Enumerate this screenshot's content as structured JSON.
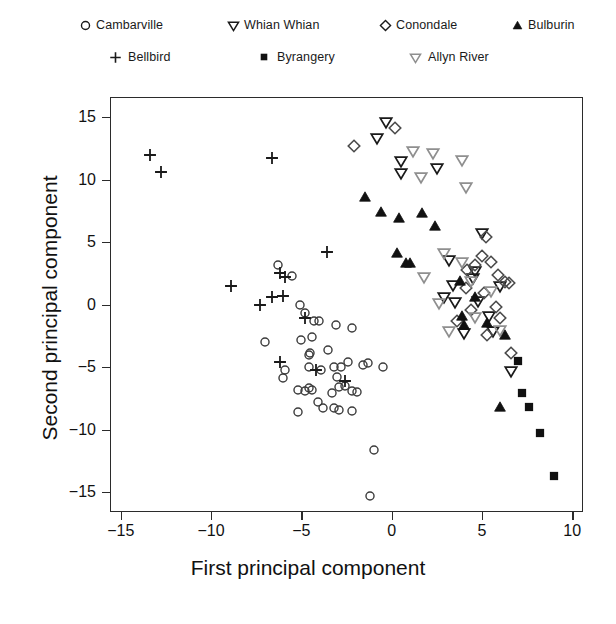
{
  "chart_data": {
    "type": "scatter",
    "title": "",
    "xlabel": "First principal component",
    "ylabel": "Second principal component",
    "xlim": [
      -15.6,
      10.6
    ],
    "ylim": [
      -16.6,
      16.6
    ],
    "xticks": [
      -15,
      -10,
      -5,
      0,
      5,
      10
    ],
    "yticks": [
      -15,
      -10,
      -5,
      0,
      5,
      10,
      15
    ],
    "xticklabels": [
      "−15",
      "−10",
      "−5",
      "0",
      "5",
      "10"
    ],
    "yticklabels": [
      "−15",
      "−10",
      "−5",
      "0",
      "5",
      "10",
      "15"
    ],
    "grid": false,
    "legend_position": "top",
    "series": [
      {
        "name": "Cambarville",
        "marker": "circle-open",
        "color": "#3b3b3b",
        "points": [
          [
            -6.3,
            3.2
          ],
          [
            -5.5,
            2.3
          ],
          [
            -5.1,
            0.0
          ],
          [
            -4.8,
            -0.7
          ],
          [
            -4.3,
            -1.3
          ],
          [
            -4.0,
            -1.3
          ],
          [
            -7.0,
            -3.0
          ],
          [
            -4.4,
            -2.6
          ],
          [
            -3.1,
            -1.6
          ],
          [
            -2.2,
            -1.9
          ],
          [
            -4.5,
            -3.9
          ],
          [
            -4.6,
            -4.0
          ],
          [
            -3.5,
            -3.6
          ],
          [
            -5.9,
            -5.2
          ],
          [
            -4.6,
            -5.0
          ],
          [
            -3.9,
            -5.2
          ],
          [
            -3.2,
            -5.0
          ],
          [
            -2.8,
            -5.0
          ],
          [
            -3.0,
            -5.8
          ],
          [
            -2.4,
            -4.6
          ],
          [
            -1.6,
            -4.8
          ],
          [
            -5.2,
            -6.8
          ],
          [
            -4.8,
            -6.9
          ],
          [
            -4.6,
            -6.7
          ],
          [
            -4.4,
            -6.8
          ],
          [
            -4.1,
            -7.8
          ],
          [
            -3.3,
            -7.1
          ],
          [
            -2.9,
            -6.6
          ],
          [
            -2.6,
            -6.5
          ],
          [
            -2.2,
            -6.9
          ],
          [
            -1.9,
            -7.0
          ],
          [
            -5.2,
            -8.6
          ],
          [
            -3.8,
            -8.3
          ],
          [
            -3.2,
            -8.3
          ],
          [
            -2.9,
            -8.4
          ],
          [
            -2.2,
            -8.5
          ],
          [
            -1.0,
            -11.6
          ],
          [
            -1.2,
            -15.3
          ],
          [
            -1.3,
            -4.7
          ],
          [
            -0.5,
            -5.0
          ],
          [
            -6.0,
            -5.9
          ],
          [
            -5.0,
            -2.8
          ]
        ]
      },
      {
        "name": "Bellbird",
        "marker": "plus",
        "color": "#1a1a1a",
        "points": [
          [
            -13.4,
            12.0
          ],
          [
            -12.8,
            10.6
          ],
          [
            -6.6,
            11.7
          ],
          [
            -3.6,
            4.2
          ],
          [
            -8.9,
            1.5
          ],
          [
            -6.2,
            2.5
          ],
          [
            -5.9,
            2.2
          ],
          [
            -7.3,
            0.0
          ],
          [
            -6.0,
            0.7
          ],
          [
            -6.6,
            0.6
          ],
          [
            -4.8,
            -1.1
          ],
          [
            -4.2,
            -5.2
          ],
          [
            -2.6,
            -6.1
          ],
          [
            -6.2,
            -4.6
          ]
        ]
      },
      {
        "name": "Whian Whian",
        "marker": "triangle-down-open",
        "color": "#1a1a1a",
        "points": [
          [
            -0.3,
            14.6
          ],
          [
            -0.8,
            13.3
          ],
          [
            0.5,
            11.5
          ],
          [
            0.5,
            10.5
          ],
          [
            2.5,
            10.9
          ],
          [
            3.2,
            3.6
          ],
          [
            4.6,
            2.7
          ],
          [
            4.5,
            2.1
          ],
          [
            3.5,
            0.2
          ],
          [
            4.8,
            0.3
          ],
          [
            5.4,
            -0.9
          ],
          [
            5.6,
            -2.1
          ],
          [
            4.0,
            -2.3
          ],
          [
            6.6,
            -5.3
          ],
          [
            3.4,
            1.6
          ],
          [
            2.9,
            0.6
          ],
          [
            5.0,
            5.7
          ],
          [
            6.0,
            1.5
          ]
        ]
      },
      {
        "name": "Byrangery",
        "marker": "square-filled",
        "color": "#111111",
        "points": [
          [
            7.0,
            -4.5
          ],
          [
            7.2,
            -7.1
          ],
          [
            7.6,
            -8.2
          ],
          [
            8.2,
            -10.3
          ],
          [
            9.0,
            -13.7
          ]
        ]
      },
      {
        "name": "Conondale",
        "marker": "diamond-open",
        "color": "#4a4a4a",
        "points": [
          [
            -2.1,
            12.7
          ],
          [
            0.2,
            14.1
          ],
          [
            5.2,
            5.4
          ],
          [
            5.0,
            3.9
          ],
          [
            5.5,
            3.4
          ],
          [
            5.9,
            2.4
          ],
          [
            4.6,
            3.2
          ],
          [
            4.2,
            2.8
          ],
          [
            6.3,
            1.8
          ],
          [
            6.5,
            1.7
          ],
          [
            5.1,
            0.9
          ],
          [
            4.4,
            -0.4
          ],
          [
            6.0,
            -1.1
          ],
          [
            5.3,
            -2.4
          ],
          [
            6.6,
            -3.9
          ],
          [
            3.6,
            -1.3
          ],
          [
            4.1,
            1.3
          ],
          [
            5.8,
            -0.2
          ]
        ]
      },
      {
        "name": "Allyn River",
        "marker": "triangle-down-gray",
        "color": "#8a8a8a",
        "points": [
          [
            1.2,
            12.3
          ],
          [
            2.3,
            12.1
          ],
          [
            3.9,
            11.6
          ],
          [
            1.6,
            10.2
          ],
          [
            4.1,
            9.4
          ],
          [
            2.9,
            4.1
          ],
          [
            3.9,
            3.4
          ],
          [
            4.4,
            1.9
          ],
          [
            2.6,
            0.1
          ],
          [
            4.6,
            -1.0
          ],
          [
            3.2,
            -2.1
          ],
          [
            6.0,
            -2.0
          ],
          [
            1.8,
            2.2
          ],
          [
            5.5,
            1.1
          ]
        ]
      },
      {
        "name": "Bulburin",
        "marker": "triangle-up-filled",
        "color": "#111111",
        "points": [
          [
            -1.5,
            8.6
          ],
          [
            -0.6,
            7.4
          ],
          [
            0.4,
            6.9
          ],
          [
            1.7,
            7.3
          ],
          [
            2.4,
            6.3
          ],
          [
            0.3,
            4.1
          ],
          [
            0.8,
            3.3
          ],
          [
            1.0,
            3.3
          ],
          [
            3.8,
            1.9
          ],
          [
            4.6,
            0.6
          ],
          [
            3.9,
            -0.9
          ],
          [
            4.0,
            -1.6
          ],
          [
            5.3,
            -1.5
          ],
          [
            6.3,
            -2.4
          ],
          [
            6.0,
            -8.2
          ]
        ]
      }
    ]
  },
  "legend": {
    "rows": [
      [
        {
          "label": "Cambarville",
          "marker": "circle-open",
          "color": "#1a1a1a",
          "x": 96,
          "mx": 74
        },
        {
          "label": "Whian Whian",
          "marker": "triangle-down-open",
          "color": "#1a1a1a",
          "x": 244,
          "mx": 222
        },
        {
          "label": "Conondale",
          "marker": "diamond-open",
          "color": "#1a1a1a",
          "x": 396,
          "mx": 374
        },
        {
          "label": "Bulburin",
          "marker": "triangle-up-filled",
          "color": "#111111",
          "x": 528,
          "mx": 506
        }
      ],
      [
        {
          "label": "Bellbird",
          "marker": "plus",
          "color": "#1a1a1a",
          "x": 128,
          "mx": 104
        },
        {
          "label": "Byrangery",
          "marker": "square-filled",
          "color": "#111111",
          "x": 277,
          "mx": 253
        },
        {
          "label": "Allyn River",
          "marker": "triangle-down-gray",
          "color": "#1a1a1a",
          "x": 428,
          "mx": 404
        }
      ]
    ]
  }
}
